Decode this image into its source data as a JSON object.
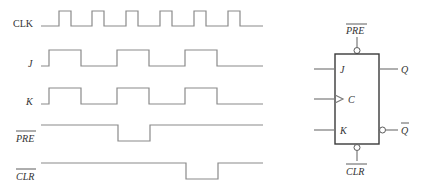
{
  "timing_diagram": {
    "signals": [
      {
        "name": "CLK",
        "label": "CLK",
        "overbar": false
      },
      {
        "name": "J",
        "label": "J",
        "overbar": false
      },
      {
        "name": "K",
        "label": "K",
        "overbar": false
      },
      {
        "name": "PRE",
        "label": "PRE",
        "overbar": true
      },
      {
        "name": "CLR",
        "label": "CLR",
        "overbar": true
      }
    ]
  },
  "flip_flop": {
    "top_input": "PRE",
    "bottom_input": "CLR",
    "inputs": {
      "j": "J",
      "clock": "C",
      "k": "K"
    },
    "outputs": {
      "q": "Q",
      "q_not": "Q"
    }
  },
  "colors": {
    "waveform": "#8a8a8a",
    "outline": "#3a3a3a",
    "text": "#333333"
  }
}
